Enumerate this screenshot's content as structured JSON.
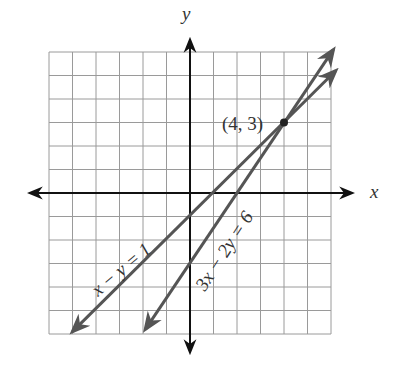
{
  "chart_data": {
    "type": "line",
    "title": "",
    "xlabel": "x",
    "ylabel": "y",
    "xlim": [
      -6,
      6
    ],
    "ylim": [
      -6,
      6
    ],
    "grid": true,
    "series": [
      {
        "name": "x − y = 1",
        "equation": "y = x - 1",
        "slope": 1,
        "intercept": -1,
        "x": [
          -5.9,
          6
        ],
        "y": [
          -6.9,
          5
        ]
      },
      {
        "name": "3x − 2y = 6",
        "equation": "y = 1.5x - 3",
        "slope": 1.5,
        "intercept": -3,
        "x": [
          -2,
          6
        ],
        "y": [
          -6,
          6
        ]
      }
    ],
    "annotations": [
      {
        "text": "(4, 3)",
        "x": 4,
        "y": 3,
        "type": "intersection-point"
      }
    ]
  },
  "labels": {
    "x_axis": "x",
    "y_axis": "y",
    "line1": "x − y = 1",
    "line2": "3x − 2y = 6",
    "point": "(4, 3)"
  },
  "colors": {
    "grid": "#9a9a9a",
    "axes": "#111111",
    "lines": "#555555",
    "text": "#333333"
  }
}
